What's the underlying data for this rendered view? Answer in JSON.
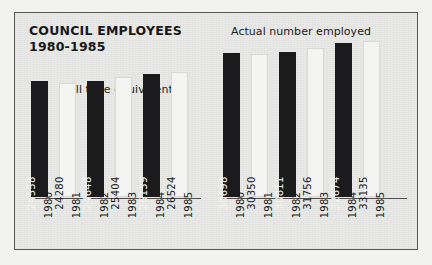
{
  "title": {
    "line1": "COUNCIL EMPLOYEES",
    "line2": "1980-1985"
  },
  "captions": {
    "left": "Full time equivalents",
    "right": "Actual number employed"
  },
  "colors": {
    "bar_dark": "#1b1b1d",
    "bar_light": "#f4f4f2",
    "panel_background": "#e9e9e7",
    "frame_border": "#565659",
    "axis_line": "#4d4d50",
    "text": "#1b1b1d"
  },
  "chart_data": {
    "type": "bar",
    "title": "COUNCIL EMPLOYEES 1980-1985",
    "xlabel": "",
    "ylabel": "",
    "grid": false,
    "legend_position": "none",
    "categories": [
      "1980",
      "1981",
      "1982",
      "1983",
      "1984",
      "1985"
    ],
    "series": [
      {
        "name": "Full time equivalents",
        "values": [
          24558,
          24280,
          24648,
          25404,
          26139,
          26524
        ],
        "labels": [
          "24558",
          "24280",
          "24648",
          "25404",
          "26139",
          "26524"
        ],
        "bar_styles": [
          "dark",
          "light",
          "dark",
          "light",
          "dark",
          "light"
        ]
      },
      {
        "name": "Actual number employed",
        "values": [
          30698,
          30350,
          30811,
          31756,
          32674,
          33135
        ],
        "labels": [
          "30698",
          "30350",
          "30811",
          "31756",
          "32674",
          "33135"
        ],
        "bar_styles": [
          "dark",
          "light",
          "dark",
          "light",
          "dark",
          "light"
        ]
      }
    ],
    "ylim": [
      0,
      34000
    ]
  }
}
